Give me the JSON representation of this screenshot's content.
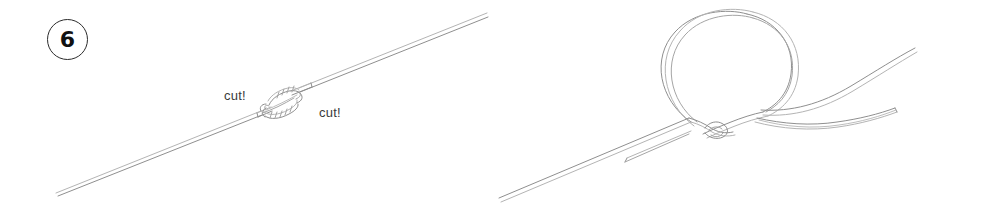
{
  "figure": {
    "width": 983,
    "height": 221,
    "background_color": "#ffffff",
    "line_color": "#9a9a9a",
    "line_highlight_color": "#c9c9c9",
    "badge_stroke_color": "#2b2b2b",
    "badge_text_color": "#111111",
    "label_text_color": "#3a3a3a"
  },
  "panels": [
    {
      "id": "panel-6",
      "step_number": "6",
      "description": "Completed blood knot joining two lines, with tag ends to be trimmed",
      "labels": [
        {
          "id": "cut-left",
          "text": "cut!"
        },
        {
          "id": "cut-right",
          "text": "cut!"
        }
      ]
    },
    {
      "id": "panel-3",
      "step_number": "3",
      "description": "Doubled line formed into a large loop with an overhand crossing at the base",
      "labels": []
    }
  ]
}
